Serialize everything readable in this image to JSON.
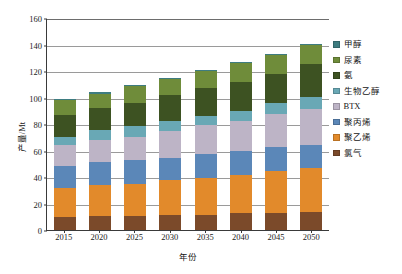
{
  "chart_data": {
    "type": "bar",
    "stacked": true,
    "title": "",
    "xlabel": "年份",
    "ylabel": "产量/Mt",
    "categories": [
      "2015",
      "2020",
      "2025",
      "2030",
      "2035",
      "2040",
      "2045",
      "2050"
    ],
    "ylim": [
      0,
      160
    ],
    "yticks": [
      0,
      20,
      40,
      60,
      80,
      100,
      120,
      140,
      160
    ],
    "grid": true,
    "legend_position": "right",
    "series": [
      {
        "name": "氯气",
        "color": "#7B4A2A",
        "values": [
          10,
          10.5,
          10.5,
          11.5,
          11.5,
          12.5,
          13,
          13.5
        ]
      },
      {
        "name": "聚乙烯",
        "color": "#E28A2B",
        "values": [
          21.5,
          23.5,
          24.5,
          26,
          27.5,
          29,
          31.5,
          33.5
        ]
      },
      {
        "name": "聚丙烯",
        "color": "#5B87B8",
        "values": [
          17,
          17,
          17.5,
          17,
          18,
          18,
          18,
          17.5
        ]
      },
      {
        "name": "BTX",
        "color": "#BDB4C6",
        "values": [
          15.5,
          17,
          18,
          20.5,
          22,
          23,
          25,
          26.5
        ]
      },
      {
        "name": "生物乙醇",
        "color": "#69A8B5",
        "values": [
          6.5,
          7.5,
          8,
          7.5,
          7,
          7.5,
          8,
          9.5
        ]
      },
      {
        "name": "氨",
        "color": "#3D5222",
        "values": [
          16.5,
          16.5,
          17.5,
          19.5,
          21,
          22,
          22,
          24.5
        ]
      },
      {
        "name": "尿素",
        "color": "#6F8C3A",
        "values": [
          11,
          11,
          12.5,
          12,
          13,
          14,
          14.5,
          14.5
        ]
      },
      {
        "name": "甲醇",
        "color": "#3E7C80",
        "values": [
          1,
          1,
          1,
          1,
          1,
          1,
          1,
          1
        ]
      }
    ],
    "totals": [
      99,
      104,
      109.5,
      115,
      121,
      127,
      133,
      140.5
    ],
    "legend_order": [
      "甲醇",
      "尿素",
      "氨",
      "生物乙醇",
      "BTX",
      "聚丙烯",
      "聚乙烯",
      "氯气"
    ]
  }
}
